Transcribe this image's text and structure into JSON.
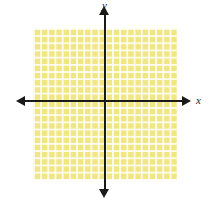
{
  "figure": {
    "background_color": "#ffffff"
  },
  "axes": {
    "x_label": "x",
    "y_label": "y",
    "axis_color": "#1a1a1a",
    "arrow_left_name": "left-arrowhead",
    "arrow_right_name": "right-arrowhead",
    "arrow_up_name": "up-arrowhead",
    "arrow_down_name": "down-arrowhead"
  },
  "grid": {
    "fill_color": "#f1e684",
    "line_color": "#ffffff",
    "cell_size_px": 7.2,
    "columns": 20,
    "rows": 21
  },
  "chart_data": {
    "type": "scatter",
    "title": "",
    "subtitle": "",
    "xlabel": "x",
    "ylabel": "y",
    "xlim": [
      -10,
      10
    ],
    "ylim": [
      -10,
      11
    ],
    "xticks": [],
    "yticks": [],
    "x": [],
    "y": [],
    "series": [],
    "annotations": [],
    "grid": true,
    "legend": "none"
  }
}
